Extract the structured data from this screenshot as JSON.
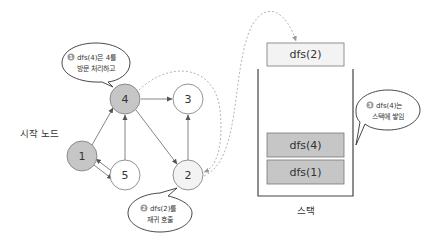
{
  "colors": {
    "visited_node_fill": "#c6c6c6",
    "current_node_fill": "#f3f3f3",
    "unvisited_node_fill": "#ffffff",
    "stack_item_fill": "#c6c6c6",
    "stack_top_fill": "#f3f3f3",
    "stroke": "#666666",
    "dashed": "#b5b5b5"
  },
  "graph": {
    "start_label": "시작 노드",
    "nodes": [
      {
        "id": "1",
        "label": "1",
        "state": "visited"
      },
      {
        "id": "2",
        "label": "2",
        "state": "current"
      },
      {
        "id": "3",
        "label": "3",
        "state": "unvisited"
      },
      {
        "id": "4",
        "label": "4",
        "state": "visited"
      },
      {
        "id": "5",
        "label": "5",
        "state": "unvisited"
      }
    ],
    "edges": [
      {
        "from": "1",
        "to": "4"
      },
      {
        "from": "1",
        "to": "5"
      },
      {
        "from": "5",
        "to": "1"
      },
      {
        "from": "5",
        "to": "4"
      },
      {
        "from": "4",
        "to": "3"
      },
      {
        "from": "4",
        "to": "2"
      },
      {
        "from": "2",
        "to": "3"
      }
    ]
  },
  "callouts": [
    {
      "number": "1",
      "line1": "dfs(4)은 4를",
      "line2": "방문 처리하고"
    },
    {
      "number": "2",
      "line1": "dfs(2)를",
      "line2": "재귀 호출"
    },
    {
      "number": "3",
      "line1": "dfs(4)는",
      "line2": "스택에 쌓임"
    }
  ],
  "stack": {
    "label": "스택",
    "incoming": "dfs(2)",
    "items": [
      "dfs(4)",
      "dfs(1)"
    ]
  }
}
